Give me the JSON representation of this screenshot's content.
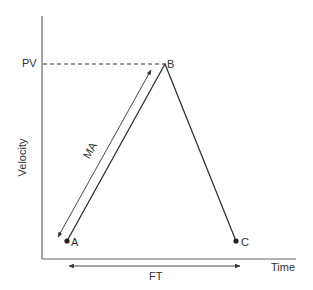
{
  "diagram": {
    "axes": {
      "y_label": "Velocity",
      "x_label": "Time"
    },
    "levels": {
      "peak_label": "PV"
    },
    "points": {
      "a": "A",
      "b": "B",
      "c": "C"
    },
    "annotations": {
      "ma": "MA",
      "ft": "FT"
    },
    "colors": {
      "line": "#333333",
      "axis": "#555555",
      "text": "#333333"
    }
  }
}
